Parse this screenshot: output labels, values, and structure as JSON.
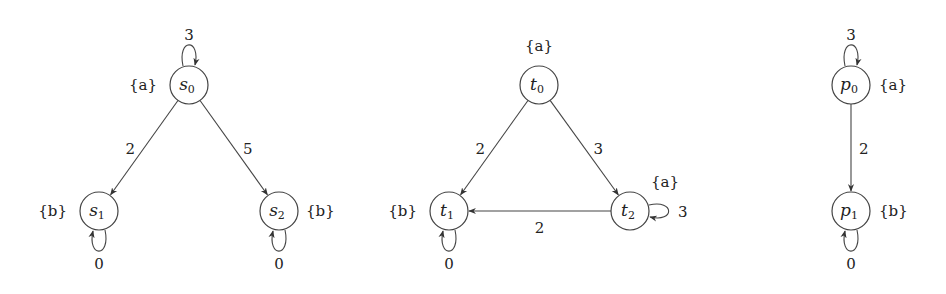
{
  "graphs": [
    {
      "id": "graph-s",
      "nodes": [
        {
          "id": "s0",
          "name": "s",
          "sub": "0",
          "cx": 189,
          "cy": 85,
          "prop": "{a}",
          "prop_x": 157,
          "prop_y": 90,
          "prop_anchor": "end"
        },
        {
          "id": "s1",
          "name": "s",
          "sub": "1",
          "cx": 99,
          "cy": 211,
          "prop": "{b}",
          "prop_x": 67,
          "prop_y": 216,
          "prop_anchor": "end"
        },
        {
          "id": "s2",
          "name": "s",
          "sub": "2",
          "cx": 279,
          "cy": 211,
          "prop": "{b}",
          "prop_x": 306,
          "prop_y": 216,
          "prop_anchor": "start"
        }
      ],
      "edges": [
        {
          "from": "s0",
          "to": "s0",
          "weight": "3",
          "type": "loop-top"
        },
        {
          "from": "s0",
          "to": "s1",
          "weight": "2"
        },
        {
          "from": "s0",
          "to": "s2",
          "weight": "5"
        },
        {
          "from": "s1",
          "to": "s1",
          "weight": "0",
          "type": "loop-bottom"
        },
        {
          "from": "s2",
          "to": "s2",
          "weight": "0",
          "type": "loop-bottom"
        }
      ]
    },
    {
      "id": "graph-t",
      "nodes": [
        {
          "id": "t0",
          "name": "t",
          "sub": "0",
          "cx": 539,
          "cy": 85,
          "prop": "{a}",
          "prop_x": 539,
          "prop_y": 51,
          "prop_anchor": "middle"
        },
        {
          "id": "t1",
          "name": "t",
          "sub": "1",
          "cx": 449,
          "cy": 211,
          "prop": "{b}",
          "prop_x": 417,
          "prop_y": 216,
          "prop_anchor": "end"
        },
        {
          "id": "t2",
          "name": "t",
          "sub": "2",
          "cx": 630,
          "cy": 211,
          "prop": "{a}",
          "prop_x": 651,
          "prop_y": 187,
          "prop_anchor": "start"
        }
      ],
      "edges": [
        {
          "from": "t0",
          "to": "t1",
          "weight": "2"
        },
        {
          "from": "t0",
          "to": "t2",
          "weight": "3"
        },
        {
          "from": "t2",
          "to": "t1",
          "weight": "2"
        },
        {
          "from": "t2",
          "to": "t2",
          "weight": "3",
          "type": "loop-right"
        },
        {
          "from": "t1",
          "to": "t1",
          "weight": "0",
          "type": "loop-bottom"
        }
      ]
    },
    {
      "id": "graph-p",
      "nodes": [
        {
          "id": "p0",
          "name": "p",
          "sub": "0",
          "cx": 851,
          "cy": 85,
          "prop": "{a}",
          "prop_x": 879,
          "prop_y": 90,
          "prop_anchor": "start"
        },
        {
          "id": "p1",
          "name": "p",
          "sub": "1",
          "cx": 851,
          "cy": 211,
          "prop": "{b}",
          "prop_x": 879,
          "prop_y": 216,
          "prop_anchor": "start"
        }
      ],
      "edges": [
        {
          "from": "p0",
          "to": "p0",
          "weight": "3",
          "type": "loop-top"
        },
        {
          "from": "p0",
          "to": "p1",
          "weight": "2"
        },
        {
          "from": "p1",
          "to": "p1",
          "weight": "0",
          "type": "loop-bottom"
        }
      ]
    }
  ],
  "style": {
    "stroke_color": "#444444",
    "node_radius": 19
  }
}
